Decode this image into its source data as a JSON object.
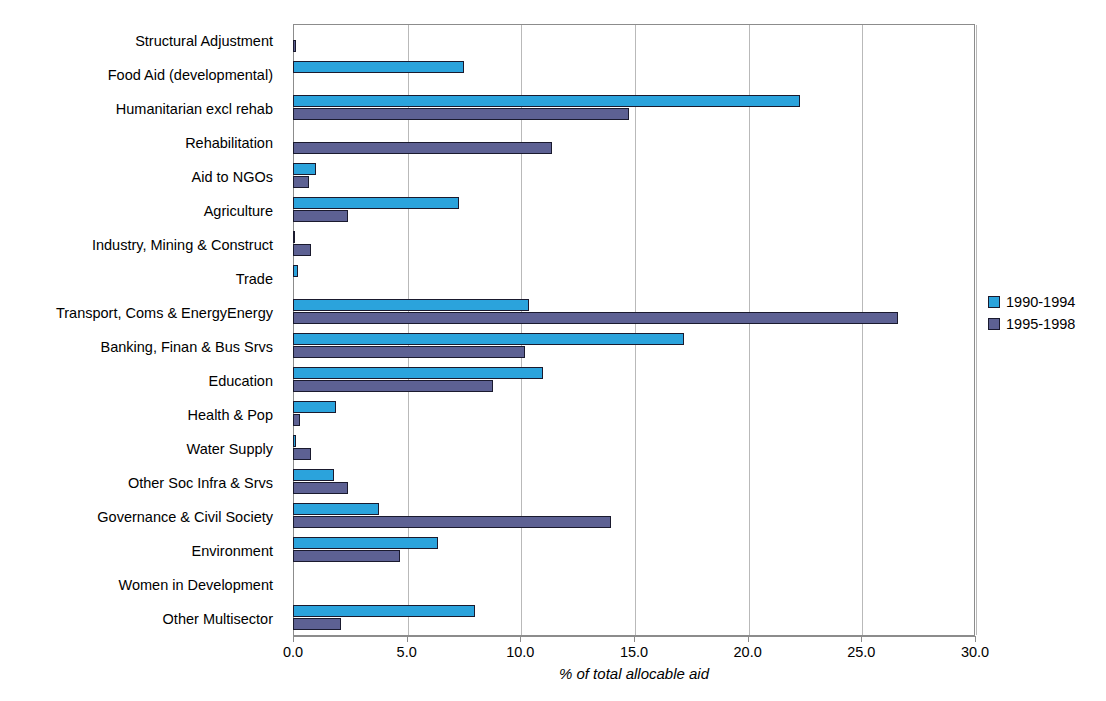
{
  "chart_data": {
    "type": "bar",
    "orientation": "horizontal",
    "xlabel": "% of total allocable aid",
    "ylabel": "",
    "xlim": [
      0.0,
      30.0
    ],
    "xticks": [
      "0.0",
      "5.0",
      "10.0",
      "15.0",
      "20.0",
      "25.0",
      "30.0"
    ],
    "xtick_values": [
      0,
      5,
      10,
      15,
      20,
      25,
      30
    ],
    "grid": true,
    "grid_axis": "x",
    "legend_position": "right",
    "categories": [
      "Structural Adjustment",
      "Food Aid (developmental)",
      "Humanitarian excl rehab",
      "Rehabilitation",
      "Aid to NGOs",
      "Agriculture",
      "Industry, Mining & Construct",
      "Trade",
      "Transport, Coms & EnergyEnergy",
      "Banking, Finan & Bus Srvs",
      "Education",
      "Health & Pop",
      "Water Supply",
      "Other Soc Infra & Srvs",
      "Governance & Civil Society",
      "Environment",
      "Women in Development",
      "Other Multisector"
    ],
    "series": [
      {
        "name": "1990-1994",
        "color": "#2ba3dc",
        "values": [
          0.0,
          7.5,
          22.3,
          0.0,
          1.0,
          7.3,
          0.1,
          0.2,
          10.4,
          17.2,
          11.0,
          1.9,
          0.15,
          1.8,
          3.8,
          6.4,
          0.0,
          8.0
        ]
      },
      {
        "name": "1995-1998",
        "color": "#5d6193",
        "values": [
          0.15,
          0.0,
          14.8,
          11.4,
          0.7,
          2.4,
          0.8,
          0.0,
          26.6,
          10.2,
          8.8,
          0.3,
          0.8,
          2.4,
          14.0,
          4.7,
          0.0,
          2.1
        ]
      }
    ]
  },
  "legend": {
    "items": [
      {
        "label": "1990-1994",
        "color": "#2ba3dc"
      },
      {
        "label": "1995-1998",
        "color": "#5d6193"
      }
    ]
  }
}
